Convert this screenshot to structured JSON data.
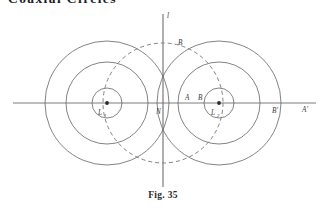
{
  "page": {
    "running_head": "Coaxial Circles",
    "caption": "Fig. 35",
    "background_color": "#ffffff",
    "ink_color": "#4a4a4a"
  },
  "figure": {
    "labels": {
      "y_axis": "l",
      "dashed_circle": "B",
      "origin": "N",
      "left_center": "L",
      "left_center_sub": "1",
      "right_center": "L",
      "right_center_sub": "2",
      "point_a": "A",
      "point_b": "B",
      "point_a_prime": "A'",
      "point_b_prime": "B'"
    },
    "geometry": {
      "x_axis": {
        "x1": 13,
        "y1": 103,
        "x2": 316,
        "y2": 103
      },
      "y_axis": {
        "x": 163,
        "y1": 14,
        "y2": 187
      },
      "left_system": {
        "cx": 107,
        "cy": 103,
        "radii": [
          15,
          41,
          62
        ],
        "center_dot": true
      },
      "right_system": {
        "cx": 219,
        "cy": 103,
        "radii": [
          15,
          41,
          62
        ],
        "center_dot": true
      },
      "radical_circle": {
        "cx": 163,
        "cy": 103,
        "r": 60,
        "dashed": true,
        "dash_pattern": "4,3"
      },
      "label_positions": {
        "y_axis": {
          "x": 167,
          "y": 18
        },
        "dashed_circle": {
          "x": 178,
          "y": 45
        },
        "origin": {
          "x": 159,
          "y": 113
        },
        "left_center": {
          "x": 99,
          "y": 114
        },
        "right_center": {
          "x": 212,
          "y": 114
        },
        "point_a": {
          "x": 186,
          "y": 100
        },
        "point_b": {
          "x": 199,
          "y": 100
        },
        "point_b_prime": {
          "x": 272,
          "y": 113
        },
        "point_a_prime": {
          "x": 303,
          "y": 112
        }
      }
    }
  }
}
